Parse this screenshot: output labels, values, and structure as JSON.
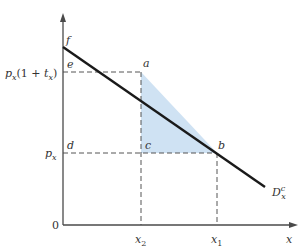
{
  "diagram": {
    "type": "demand-curve-tax-deadweight-loss",
    "axes": {
      "origin_label": "0",
      "x_label": "x",
      "y_label": ""
    },
    "curve": {
      "label_main": "D",
      "label_sup": "c",
      "label_sub": "x",
      "color": "#1a1a1a"
    },
    "points": {
      "f": "f",
      "e": "e",
      "a": "a",
      "d": "d",
      "c": "c",
      "b": "b"
    },
    "y_ticks": {
      "high_price": {
        "p": "p",
        "p_sub": "x",
        "rest_open": "(1 + ",
        "t": "t",
        "t_sub": "x",
        "rest_close": ")"
      },
      "low_price": {
        "p": "p",
        "p_sub": "x"
      }
    },
    "x_ticks": {
      "x2": {
        "main": "x",
        "sub": "2"
      },
      "x1": {
        "main": "x",
        "sub": "1"
      }
    },
    "colors": {
      "shaded_triangle": "#cfe2f3",
      "axis": "#4a4a4a",
      "dashed": "#555555"
    }
  }
}
